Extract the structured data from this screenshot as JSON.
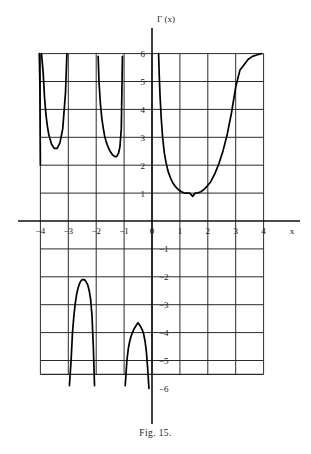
{
  "figure": {
    "caption": "Fig. 15.",
    "y_axis_title": "Γ (x)",
    "x_axis_title": "x",
    "noise_row": "·  ·   ·   ··    ·     ·   ·"
  },
  "chart_data": {
    "type": "line",
    "title": "Γ (x)",
    "xlabel": "x",
    "ylabel": "Γ (x)",
    "xlim": [
      -4.5,
      4.8
    ],
    "ylim": [
      -6.2,
      6.3
    ],
    "grid": true,
    "legend": null,
    "xticks": [
      -4,
      -3,
      -2,
      -1,
      0,
      1,
      2,
      3,
      4
    ],
    "xticklabels": [
      "−4",
      "−3",
      "−2",
      "−1",
      "0",
      "1",
      "2",
      "3",
      "4"
    ],
    "yticks": [
      6,
      5,
      4,
      3,
      2,
      1,
      -1,
      -2,
      -3,
      -4,
      -5,
      -6
    ],
    "yticklabels": [
      "6",
      "5",
      "4",
      "3",
      "2",
      "1",
      "−1",
      "−2",
      "−3",
      "−4",
      "−5",
      "−6"
    ],
    "series": [
      {
        "name": "Gamma branch x > 0",
        "x": [
          0.236,
          0.26,
          0.29,
          0.33,
          0.38,
          0.44,
          0.5,
          0.58,
          0.66,
          0.75,
          0.85,
          0.95,
          1.05,
          1.15,
          1.25,
          1.35,
          1.4616,
          1.55,
          1.65,
          1.75,
          1.85,
          1.95,
          2.1,
          2.25,
          2.4,
          2.55,
          2.7,
          2.85,
          3.0,
          3.15,
          3.3,
          3.45,
          3.6,
          3.75,
          3.85,
          3.93
        ],
        "y": [
          6.0,
          5.22,
          4.45,
          3.69,
          3.01,
          2.45,
          2.11,
          1.77,
          1.55,
          1.36,
          1.22,
          1.12,
          1.05,
          1.01,
          1.0,
          1.0,
          0.8856,
          1.0,
          1.01,
          1.05,
          1.12,
          1.22,
          1.4,
          1.69,
          2.06,
          2.53,
          3.12,
          3.88,
          4.8,
          5.4,
          5.6,
          5.8,
          5.9,
          5.95,
          5.98,
          6.0
        ],
        "style": "solid"
      },
      {
        "name": "Gamma branch −1 < x < 0",
        "x": [
          -0.96,
          -0.9,
          -0.85,
          -0.8,
          -0.75,
          -0.7,
          -0.65,
          -0.6,
          -0.55,
          -0.5041,
          -0.45,
          -0.4,
          -0.35,
          -0.3,
          -0.25,
          -0.2,
          -0.15,
          -0.11
        ],
        "y": [
          -5.9,
          -5.0,
          -4.58,
          -4.32,
          -4.13,
          -4.0,
          -3.88,
          -3.8,
          -3.72,
          -3.6449,
          -3.72,
          -3.8,
          -3.9,
          -4.05,
          -4.3,
          -4.7,
          -5.35,
          -6.0
        ],
        "style": "solid"
      },
      {
        "name": "Gamma branch −2 < x < −1",
        "x": [
          -1.93,
          -1.9,
          -1.85,
          -1.8,
          -1.75,
          -1.7,
          -1.65,
          -1.6,
          -1.55,
          -1.5,
          -1.45,
          -1.4,
          -1.35,
          -1.3,
          -1.25,
          -1.2,
          -1.15,
          -1.1,
          -1.06
        ],
        "y": [
          5.9,
          5.0,
          4.2,
          3.7,
          3.35,
          3.06,
          2.87,
          2.72,
          2.6,
          2.5,
          2.42,
          2.36,
          2.32,
          2.3,
          2.33,
          2.43,
          2.66,
          3.3,
          5.9
        ],
        "style": "solid"
      },
      {
        "name": "Gamma branch −3 < x < −2",
        "x": [
          -2.96,
          -2.9,
          -2.85,
          -2.8,
          -2.75,
          -2.7,
          -2.65,
          -2.6,
          -2.55,
          -2.5,
          -2.4575,
          -2.4,
          -2.35,
          -2.3,
          -2.25,
          -2.2,
          -2.15,
          -2.1,
          -2.06
        ],
        "y": [
          -5.9,
          -5.0,
          -4.0,
          -3.4,
          -2.95,
          -2.62,
          -2.4,
          -2.25,
          -2.15,
          -2.1,
          -2.1,
          -2.12,
          -2.2,
          -2.3,
          -2.5,
          -2.8,
          -3.4,
          -4.6,
          -5.9
        ],
        "style": "solid"
      },
      {
        "name": "Gamma branch −4 < x < −3",
        "x": [
          -3.96,
          -3.9,
          -3.85,
          -3.8,
          -3.75,
          -3.7,
          -3.6,
          -3.5,
          -3.4,
          -3.3,
          -3.2,
          -3.1,
          -3.05
        ],
        "y": [
          6.0,
          5.3,
          4.4,
          3.8,
          3.4,
          3.1,
          2.75,
          2.6,
          2.6,
          2.8,
          3.3,
          4.6,
          6.0
        ],
        "style": "solid"
      },
      {
        "name": "Gamma branch x < −4 (edge)",
        "x": [
          -4.04,
          -4.02,
          -4.0
        ],
        "y": [
          6.0,
          5.0,
          2.0
        ],
        "style": "solid"
      }
    ]
  }
}
